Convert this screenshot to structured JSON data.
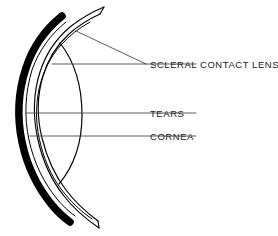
{
  "figure": {
    "background_color": "#ffffff",
    "ink_color": "#000000",
    "leader_color": "#4a4a4a",
    "width": 278,
    "height": 236
  },
  "labels": [
    {
      "id": "scleral-contact-lens",
      "text": "SCLERAL CONTACT LENS",
      "x": 150,
      "y": 68
    },
    {
      "id": "tears",
      "text": "TEARS",
      "x": 150,
      "y": 120
    },
    {
      "id": "cornea",
      "text": "CORNEA",
      "x": 150,
      "y": 142
    }
  ],
  "structures": [
    {
      "id": "sclera",
      "name": "sclera",
      "style": "thick-black-arc"
    },
    {
      "id": "scleral-lens",
      "name": "scleral contact lens",
      "style": "thin-outline"
    },
    {
      "id": "tear-layer",
      "name": "tear layer",
      "style": "thin-line"
    },
    {
      "id": "cornea-arc",
      "name": "cornea",
      "style": "thin-arc"
    }
  ],
  "leaders": {
    "scleral_vertex_x": 146,
    "scleral_vertex_y": 64,
    "tears_start_x": 26,
    "tears_start_y": 113,
    "cornea_start_x": 30,
    "cornea_start_y": 136
  }
}
